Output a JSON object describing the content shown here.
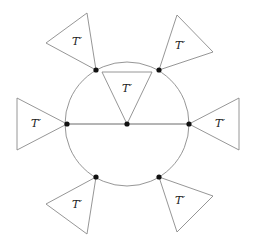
{
  "diagram": {
    "colors": {
      "stroke": "#8a8a8a",
      "node": "#111111",
      "background": "#ffffff"
    },
    "circle": {
      "cx": 127,
      "cy": 124,
      "r": 62
    },
    "diameter": {
      "x1": 67,
      "y1": 124,
      "x2": 189,
      "y2": 124
    },
    "nodes": [
      {
        "id": "top-left",
        "x": 96,
        "y": 70
      },
      {
        "id": "top-right",
        "x": 159,
        "y": 70
      },
      {
        "id": "left",
        "x": 67,
        "y": 124
      },
      {
        "id": "center",
        "x": 127,
        "y": 124
      },
      {
        "id": "right",
        "x": 189,
        "y": 124
      },
      {
        "id": "bottom-left",
        "x": 96,
        "y": 177
      },
      {
        "id": "bottom-right",
        "x": 159,
        "y": 177
      }
    ],
    "triangles": [
      {
        "id": "top-left",
        "points": "87,13 46,43 96,70",
        "label": "T′",
        "lx": 77,
        "ly": 42
      },
      {
        "id": "top-right",
        "points": "177,15 213,52 159,70",
        "label": "T′",
        "lx": 180,
        "ly": 46
      },
      {
        "id": "center",
        "points": "102,72 152,72 127,124",
        "label": "T′",
        "lx": 127,
        "ly": 89
      },
      {
        "id": "left",
        "points": "17,98 17,150 67,124",
        "label": "T′",
        "lx": 36,
        "ly": 124
      },
      {
        "id": "right",
        "points": "239,98 239,150 189,124",
        "label": "T′",
        "lx": 220,
        "ly": 124
      },
      {
        "id": "bottom-left",
        "points": "46,204 87,234 96,177",
        "label": "T′",
        "lx": 77,
        "ly": 205
      },
      {
        "id": "bottom-right",
        "points": "213,196 177,232 159,177",
        "label": "T′",
        "lx": 180,
        "ly": 201
      }
    ]
  }
}
